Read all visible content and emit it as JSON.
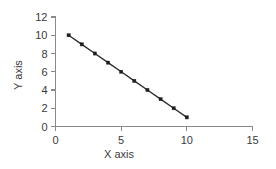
{
  "chart_data": {
    "type": "line",
    "title": "",
    "subtitle": "",
    "xlabel": "X axis",
    "ylabel": "Y axis",
    "xlim": [
      0,
      15
    ],
    "ylim": [
      0,
      12
    ],
    "xticks": [
      0,
      5,
      10,
      15
    ],
    "yticks": [
      0,
      2,
      4,
      6,
      8,
      10,
      12
    ],
    "xtick_labels": [
      "0",
      "5",
      "10",
      "15"
    ],
    "ytick_labels": [
      "0",
      "2",
      "4",
      "6",
      "8",
      "10",
      "12"
    ],
    "grid": false,
    "legend": false,
    "legend_position": "none",
    "marker": "square",
    "line_color": "#2b2b2b",
    "marker_color": "#1e1e1e",
    "axis_color": "#8a8a8a",
    "background_color": "#ffffff",
    "x": [
      1,
      2,
      3,
      4,
      5,
      6,
      7,
      8,
      9,
      10
    ],
    "series": [
      {
        "name": "",
        "values": [
          10,
          9,
          8,
          7,
          6,
          5,
          4,
          3,
          2,
          1
        ]
      }
    ],
    "points": [
      {
        "x": 1,
        "y": 10
      },
      {
        "x": 2,
        "y": 9
      },
      {
        "x": 3,
        "y": 8
      },
      {
        "x": 4,
        "y": 7
      },
      {
        "x": 5,
        "y": 6
      },
      {
        "x": 6,
        "y": 5
      },
      {
        "x": 7,
        "y": 4
      },
      {
        "x": 8,
        "y": 3
      },
      {
        "x": 9,
        "y": 2
      },
      {
        "x": 10,
        "y": 1
      }
    ]
  },
  "axis_titles": {
    "x": "X axis",
    "y": "Y axis"
  }
}
